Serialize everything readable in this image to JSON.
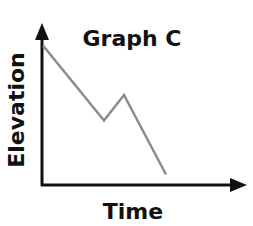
{
  "chart_data": {
    "type": "line",
    "title": "Graph C",
    "xlabel": "Time",
    "ylabel": "Elevation",
    "x_ticks": [],
    "y_ticks": [],
    "grid": false,
    "legend": null,
    "xlim": [
      0,
      10
    ],
    "ylim": [
      0,
      10
    ],
    "series": [
      {
        "name": "Elevation",
        "color": "#8c8c8c",
        "points": [
          {
            "x": 0.05,
            "y": 9.3
          },
          {
            "x": 3.1,
            "y": 4.3
          },
          {
            "x": 4.1,
            "y": 6.0
          },
          {
            "x": 6.2,
            "y": 0.7
          }
        ]
      }
    ]
  },
  "colors": {
    "axis": "#111111",
    "line": "#8c8c8c",
    "text": "#111111",
    "background": "#ffffff"
  }
}
